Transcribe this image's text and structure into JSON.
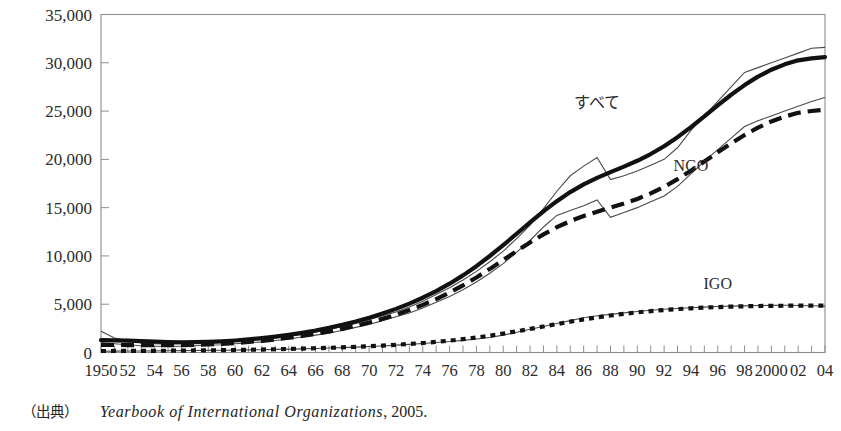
{
  "chart_data": {
    "type": "line",
    "title": "",
    "xlabel": "",
    "ylabel": "",
    "ylim": [
      0,
      35000
    ],
    "xlim": [
      1950,
      2004
    ],
    "grid": false,
    "legend_position": "inline-annotations",
    "ytick_labels": [
      "0",
      "5,000",
      "10,000",
      "15,000",
      "20,000",
      "25,000",
      "30,000",
      "35,000"
    ],
    "ytick_values": [
      0,
      5000,
      10000,
      15000,
      20000,
      25000,
      30000,
      35000
    ],
    "xtick_labels": [
      "1950",
      "52",
      "54",
      "56",
      "58",
      "60",
      "62",
      "64",
      "66",
      "68",
      "70",
      "72",
      "74",
      "76",
      "78",
      "80",
      "82",
      "84",
      "86",
      "88",
      "90",
      "92",
      "94",
      "96",
      "98",
      "2000",
      "02",
      "04"
    ],
    "xtick_values": [
      1950,
      1952,
      1954,
      1956,
      1958,
      1960,
      1962,
      1964,
      1966,
      1968,
      1970,
      1972,
      1974,
      1976,
      1978,
      1980,
      1982,
      1984,
      1986,
      1988,
      1990,
      1992,
      1994,
      1996,
      1998,
      2000,
      2002,
      2004
    ],
    "x": [
      1950,
      1951,
      1952,
      1953,
      1954,
      1955,
      1956,
      1957,
      1958,
      1959,
      1960,
      1961,
      1962,
      1963,
      1964,
      1965,
      1966,
      1967,
      1968,
      1969,
      1970,
      1971,
      1972,
      1973,
      1974,
      1975,
      1976,
      1977,
      1978,
      1979,
      1980,
      1981,
      1982,
      1983,
      1984,
      1985,
      1986,
      1987,
      1988,
      1989,
      1990,
      1991,
      1992,
      1993,
      1994,
      1995,
      1996,
      1997,
      1998,
      1999,
      2000,
      2001,
      2002,
      2003,
      2004
    ],
    "series": [
      {
        "name": "すべて",
        "label": "すべて",
        "style": "solid-thick-trend-with-thin-actual",
        "values": [
          2200,
          1500,
          1200,
          1000,
          900,
          850,
          900,
          950,
          1000,
          1050,
          1150,
          1250,
          1350,
          1500,
          1700,
          1900,
          2100,
          2400,
          2700,
          3000,
          3400,
          3800,
          4200,
          4700,
          5300,
          6000,
          6700,
          7500,
          8400,
          9400,
          10500,
          11800,
          13200,
          14900,
          16700,
          18300,
          19300,
          20200,
          17900,
          18300,
          18800,
          19400,
          20000,
          21200,
          23000,
          24500,
          26000,
          27500,
          29000,
          29500,
          30000,
          30500,
          31000,
          31500,
          31600
        ]
      },
      {
        "name": "NGO",
        "label": "NGO",
        "style": "long-dash-thick-trend-with-thin-actual",
        "values": [
          1000,
          900,
          800,
          700,
          650,
          620,
          650,
          700,
          750,
          800,
          900,
          1000,
          1100,
          1250,
          1400,
          1600,
          1800,
          2000,
          2300,
          2600,
          2900,
          3300,
          3700,
          4100,
          4600,
          5200,
          5800,
          6500,
          7300,
          8200,
          9200,
          10400,
          11600,
          13000,
          14200,
          14700,
          15200,
          15800,
          14000,
          14500,
          15000,
          15600,
          16200,
          17200,
          18500,
          19800,
          21000,
          22200,
          23400,
          24000,
          24500,
          25000,
          25500,
          26000,
          26400
        ]
      },
      {
        "name": "IGO",
        "label": "IGO",
        "style": "short-dash-thick-trend-with-thin-actual",
        "values": [
          130,
          140,
          150,
          160,
          170,
          180,
          190,
          200,
          215,
          230,
          250,
          270,
          290,
          320,
          350,
          380,
          420,
          460,
          500,
          560,
          620,
          680,
          760,
          840,
          930,
          1030,
          1140,
          1260,
          1400,
          1560,
          1800,
          2100,
          2400,
          2700,
          3000,
          3300,
          3600,
          3800,
          3950,
          4100,
          4250,
          4380,
          4480,
          4560,
          4640,
          4700,
          4760,
          4800,
          4830,
          4860,
          4880,
          4890,
          4870,
          4840,
          4800
        ]
      }
    ],
    "annotations": [
      {
        "text": "すべて",
        "x": 1987,
        "y": 25300
      },
      {
        "text": "NGO",
        "x": 1994,
        "y": 18800
      },
      {
        "text": "IGO",
        "x": 1996,
        "y": 6600
      }
    ]
  },
  "source_note": {
    "label": "（出典）",
    "title": "Yearbook of International Organizations",
    "year": ", 2005."
  }
}
